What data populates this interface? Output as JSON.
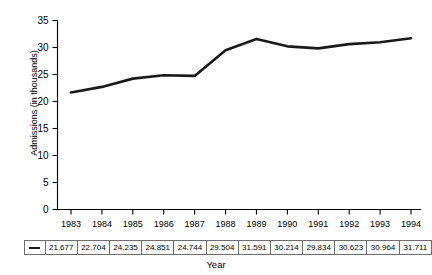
{
  "chart_data": {
    "type": "line",
    "title": "",
    "xlabel": "Year",
    "ylabel": "Admissions (in thousands)",
    "categories": [
      "1983",
      "1984",
      "1985",
      "1986",
      "1987",
      "1988",
      "1989",
      "1990",
      "1991",
      "1992",
      "1993",
      "1994"
    ],
    "values": [
      21.677,
      22.704,
      24.235,
      24.851,
      24.744,
      29.504,
      31.591,
      30.214,
      29.834,
      30.623,
      30.964,
      31.711
    ],
    "value_labels": [
      "21.677",
      "22.704",
      "24.235",
      "24.851",
      "24.744",
      "29.504",
      "31.591",
      "30.214",
      "29.834",
      "30.623",
      "30.964",
      "31.711"
    ],
    "ylim": [
      0,
      35
    ],
    "y_ticks": [
      0,
      5,
      10,
      15,
      20,
      25,
      30,
      35
    ],
    "y_tick_labels": [
      "0",
      "5",
      "10",
      "15",
      "20",
      "25",
      "30",
      "35"
    ],
    "grid": false,
    "legend_position": "data-table",
    "series": [
      {
        "name": "Admissions",
        "marker": "line-swatch",
        "color": "#1a1a1a",
        "values": [
          21.677,
          22.704,
          24.235,
          24.851,
          24.744,
          29.504,
          31.591,
          30.214,
          29.834,
          30.623,
          30.964,
          31.711
        ]
      }
    ]
  },
  "axes": {
    "y_title": "Admissions (in thousands)",
    "x_title": "Year"
  },
  "colors": {
    "line": "#1a1a1a",
    "axis": "#000000",
    "table_border": "#6e6e6e",
    "background": "#ffffff"
  }
}
